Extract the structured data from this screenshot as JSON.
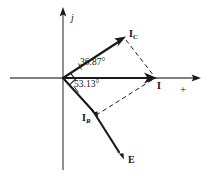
{
  "figure": {
    "type": "phasor-diagram",
    "background_color": "#ffffff",
    "stroke_color": "#1a1a1a",
    "axis_color": "#555555"
  },
  "axes": {
    "imaginary_axis_label": "j",
    "real_axis_label": "+",
    "origin": {
      "x": 63,
      "y": 78
    },
    "vertical_axis": {
      "x": 63,
      "y_top": 8,
      "y_bottom": 170,
      "arrow": "up"
    },
    "horizontal_axis": {
      "y": 78,
      "x_left": 10,
      "x_right": 200,
      "arrow": "right"
    }
  },
  "vectors": [
    {
      "name": "I_C",
      "label_text": "I",
      "label_subscript": "C",
      "angle_degrees": 36.87,
      "from": {
        "x": 63,
        "y": 78
      },
      "to": {
        "x": 124,
        "y": 38
      },
      "style": "solid"
    },
    {
      "name": "I",
      "label_text": "I",
      "label_subscript": "",
      "angle_degrees": 0,
      "from": {
        "x": 63,
        "y": 78
      },
      "to": {
        "x": 155,
        "y": 78
      },
      "style": "solid"
    },
    {
      "name": "I_R",
      "label_text": "I",
      "label_subscript": "R",
      "angle_degrees": -53.13,
      "from": {
        "x": 63,
        "y": 78
      },
      "to": {
        "x": 97,
        "y": 116
      },
      "style": "solid"
    },
    {
      "name": "E",
      "label_text": "E",
      "label_subscript": "",
      "angle_degrees": -53.13,
      "from": {
        "x": 63,
        "y": 78
      },
      "to": {
        "x": 123,
        "y": 158
      },
      "style": "solid"
    }
  ],
  "construction_lines": [
    {
      "name": "ic-to-i-dashed",
      "from": {
        "x": 124,
        "y": 38
      },
      "to": {
        "x": 155,
        "y": 78
      },
      "style": "dashed"
    },
    {
      "name": "i-to-ir-dashed",
      "from": {
        "x": 155,
        "y": 78
      },
      "to": {
        "x": 97,
        "y": 116
      },
      "style": "dashed"
    }
  ],
  "angle_annotations": [
    {
      "name": "angle-ic",
      "value": "36.87°",
      "between": [
        "I_C",
        "I"
      ]
    },
    {
      "name": "angle-ir",
      "value": "53.13°",
      "between": [
        "I",
        "I_R"
      ]
    }
  ],
  "right_angle_marker": {
    "name": "right-angle-origin",
    "present": true,
    "at": {
      "x": 63,
      "y": 78
    },
    "between": [
      "I_C",
      "I_R"
    ]
  }
}
